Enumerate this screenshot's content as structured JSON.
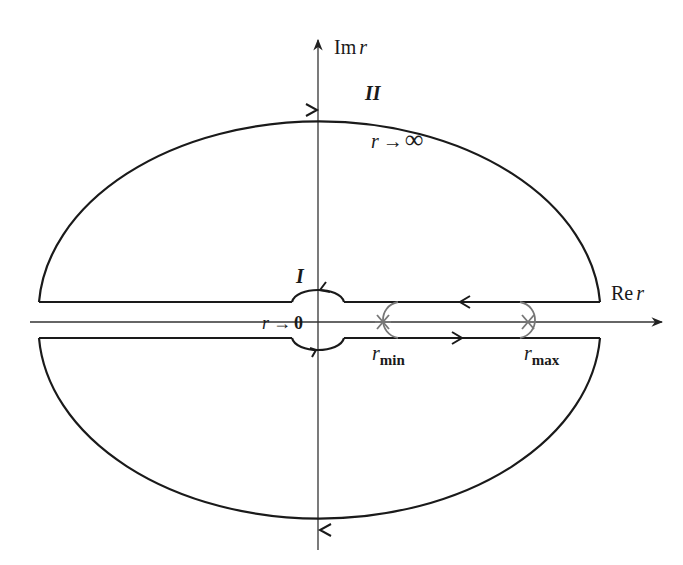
{
  "diagram": {
    "axes": {
      "imag_label_prefix": "Im",
      "imag_label_var": "r",
      "real_label_prefix": "Re",
      "real_label_var": "r"
    },
    "labels": {
      "outer_contour": "II",
      "inner_contour": "I",
      "infinity_var": "r",
      "infinity_arrow": "→",
      "infinity_symbol": "∞",
      "zero_var": "r",
      "zero_arrow": "→",
      "zero_symbol": "0",
      "rmin_var": "r",
      "rmin_sub": "min",
      "rmax_var": "r",
      "rmax_sub": "max"
    },
    "colors": {
      "contour": "#1a1a1a",
      "axis": "#333333",
      "turning_point_contour": "#777777"
    }
  }
}
